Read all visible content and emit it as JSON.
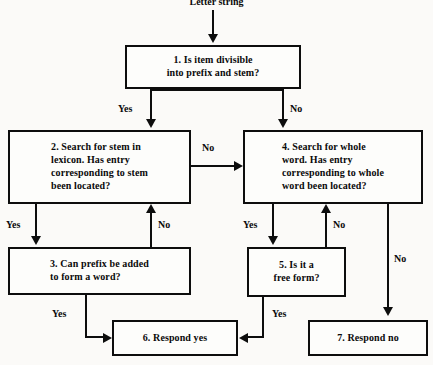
{
  "diagram": {
    "caption": "Letter string",
    "type": "flowchart",
    "nodes": [
      {
        "id": "box1",
        "label": "1.  Is item divisible\ninto prefix and stem?"
      },
      {
        "id": "box2",
        "label": "2.  Search for stem in\nlexicon. Has entry\ncorresponding to stem\nbeen located?"
      },
      {
        "id": "box3",
        "label": "3. Can prefix be added\nto form a word?"
      },
      {
        "id": "box4",
        "label": "4.  Search for whole\nword. Has entry\ncorresponding to whole\nword been located?"
      },
      {
        "id": "box5",
        "label": "5.  Is it a\nfree form?"
      },
      {
        "id": "box6",
        "label": "6.  Respond yes"
      },
      {
        "id": "box7",
        "label": "7.  Respond no"
      }
    ],
    "edges": [
      {
        "id": "e1",
        "from": "box1",
        "to": "box2",
        "label": "Yes"
      },
      {
        "id": "e2",
        "from": "box1",
        "to": "box4",
        "label": "No"
      },
      {
        "id": "e3",
        "from": "box2",
        "to": "box4",
        "label": "No"
      },
      {
        "id": "e4",
        "from": "box2",
        "to": "box3",
        "label": "Yes"
      },
      {
        "id": "e5",
        "from": "box3",
        "to": "box2",
        "label": "No"
      },
      {
        "id": "e6",
        "from": "box3",
        "to": "box6",
        "label": "Yes"
      },
      {
        "id": "e7",
        "from": "box4",
        "to": "box5",
        "label": "Yes"
      },
      {
        "id": "e8",
        "from": "box5",
        "to": "box4",
        "label": "No"
      },
      {
        "id": "e9",
        "from": "box4",
        "to": "box7",
        "label": "No"
      },
      {
        "id": "e10",
        "from": "box5",
        "to": "box6",
        "label": "Yes"
      }
    ],
    "colors": {
      "ink": "#0d0d0d",
      "paper": "#fbfaf8",
      "box_fill": "#fdfdfb"
    }
  }
}
